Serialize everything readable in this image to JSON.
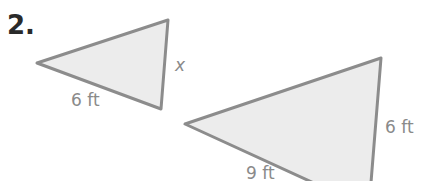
{
  "problem": {
    "number": "2."
  },
  "triangles": [
    {
      "id": "small",
      "labels": {
        "bottom_side": "6 ft",
        "right_side": "x"
      }
    },
    {
      "id": "large",
      "labels": {
        "bottom_side": "9 ft",
        "right_side": "6 ft"
      }
    }
  ],
  "colors": {
    "fill": "#ececec",
    "stroke": "#8c8c8c",
    "label": "#8a8a8a",
    "number": "#2a2a2a"
  }
}
